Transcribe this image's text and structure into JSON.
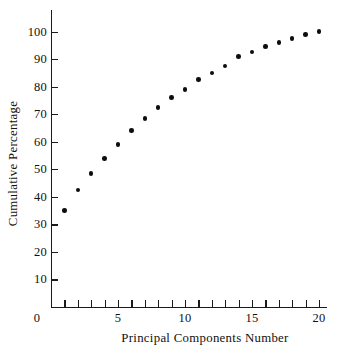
{
  "chart_data": {
    "type": "scatter",
    "title": "",
    "xlabel": "Principal Components Number",
    "ylabel": "Cumulative Percentage",
    "x": [
      1,
      2,
      3,
      4,
      5,
      6,
      7,
      8,
      9,
      10,
      11,
      12,
      13,
      14,
      15,
      16,
      17,
      18,
      19,
      20
    ],
    "values": [
      35,
      42.5,
      48.5,
      54,
      59,
      64,
      68.5,
      72.5,
      76,
      79,
      82.5,
      85,
      87.5,
      91,
      92.5,
      94.5,
      96,
      97.5,
      99,
      100
    ],
    "xlim": [
      0,
      20.6
    ],
    "ylim": [
      0,
      108
    ],
    "x_ticks_labeled": [
      0,
      5,
      10,
      15,
      20
    ],
    "x_ticks_minor": [
      1,
      2,
      3,
      4,
      5,
      6,
      7,
      8,
      9,
      10,
      11,
      12,
      13,
      14,
      15,
      16,
      17,
      18,
      19,
      20
    ],
    "y_ticks_labeled": [
      10,
      20,
      30,
      40,
      50,
      60,
      70,
      80,
      90,
      100
    ],
    "grid": false,
    "legend": null,
    "marker": "filled-circle",
    "marker_color": "#0d0d0d",
    "axis_color": "#1a1a1a",
    "background": "#ffffff"
  },
  "axes": {
    "y_tick_labels": [
      "100",
      "90",
      "80",
      "70",
      "60",
      "50",
      "40",
      "30",
      "20",
      "10"
    ],
    "x_tick_labels": [
      "0",
      "5",
      "10",
      "15",
      "20"
    ],
    "y_title": "Cumulative Percentage",
    "x_title": "Principal Components Number"
  }
}
